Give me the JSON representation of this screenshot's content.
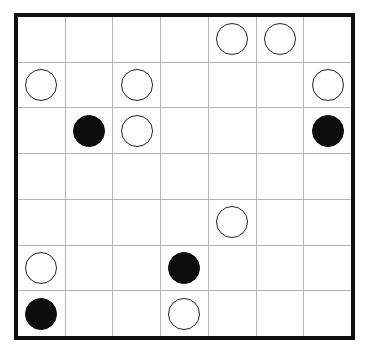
{
  "board": {
    "name": "masyu-style-grid-puzzle",
    "rows": 7,
    "columns": 7,
    "frame_color": "#101010",
    "gridline_color": "#b4b4b4",
    "background_color": "#ffffff",
    "stone_white_fill": "#ffffff",
    "stone_white_stroke": "#232323",
    "stone_black_fill": "#0d0d0d",
    "legend": {
      "empty": "",
      "white": "white-circle",
      "black": "black-circle"
    },
    "cells": [
      [
        "",
        "",
        "",
        "",
        "white",
        "white",
        ""
      ],
      [
        "white",
        "",
        "white",
        "",
        "",
        "",
        "white"
      ],
      [
        "",
        "black",
        "white",
        "",
        "",
        "",
        "black"
      ],
      [
        "",
        "",
        "",
        "",
        "",
        "",
        ""
      ],
      [
        "",
        "",
        "",
        "",
        "white",
        "",
        ""
      ],
      [
        "white",
        "",
        "",
        "black",
        "",
        "",
        ""
      ],
      [
        "black",
        "",
        "",
        "white",
        "",
        "",
        ""
      ]
    ]
  }
}
